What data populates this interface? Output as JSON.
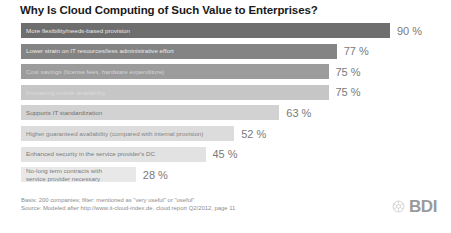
{
  "chart_data": {
    "type": "bar",
    "orientation": "horizontal",
    "title": "Why Is Cloud Computing of Such Value to Enterprises?",
    "xlabel": "",
    "ylabel": "",
    "xlim": [
      0,
      100
    ],
    "grid": false,
    "legend": null,
    "value_suffix": "%",
    "categories": [
      "More flexibility/needs-based provision",
      "Lower strain on IT resources/less administrative effort",
      "Cost savings (license fees, hardware expenditure)",
      "Increasing mobile availability",
      "Supports IT standardization",
      "Higher guaranteed availability (compared with internal provision)",
      "Enhanced security in the service provider's DC",
      "No-long term contracts with service provider necessary"
    ],
    "values": [
      90,
      77,
      75,
      75,
      63,
      52,
      45,
      28
    ],
    "value_labels": [
      "90 %",
      "77 %",
      "75 %",
      "75 %",
      "63 %",
      "52 %",
      "45 %",
      "28 %"
    ],
    "bar_colors": [
      "#6e6e6e",
      "#848484",
      "#9c9c9c",
      "#c6c6c6",
      "#d2d2d2",
      "#dcdcdc",
      "#e2e2e2",
      "#e8e8e8"
    ],
    "label_colors": [
      "#e8e8e8",
      "#eaeaea",
      "#d4d4d4",
      "#dedede",
      "#6f6f6f",
      "#858585",
      "#7a7a7a",
      "#7a7a7a"
    ]
  },
  "bars": [
    {
      "label": "More flexibility/needs-based provision",
      "value": 90,
      "value_label": "90 %",
      "bar_color": "#6e6e6e",
      "label_color": "#e8e8e8",
      "two_line": false
    },
    {
      "label": "Lower strain on IT resources/less administrative effort",
      "value": 77,
      "value_label": "77 %",
      "bar_color": "#848484",
      "label_color": "#eaeaea",
      "two_line": false
    },
    {
      "label": "Cost savings (license fees, hardware expenditure)",
      "value": 75,
      "value_label": "75 %",
      "bar_color": "#9c9c9c",
      "label_color": "#d4d4d4",
      "two_line": false
    },
    {
      "label": "Increasing mobile availability",
      "value": 75,
      "value_label": "75 %",
      "bar_color": "#c6c6c6",
      "label_color": "#dcdcdc",
      "two_line": false
    },
    {
      "label": "Supports IT standardization",
      "value": 63,
      "value_label": "63 %",
      "bar_color": "#d2d2d2",
      "label_color": "#6f6f6f",
      "two_line": false
    },
    {
      "label": "Higher guaranteed availability (compared with internal provision)",
      "value": 52,
      "value_label": "52 %",
      "bar_color": "#dcdcdc",
      "label_color": "#858585",
      "two_line": false
    },
    {
      "label": "Enhanced security in the service provider's DC",
      "value": 45,
      "value_label": "45 %",
      "bar_color": "#e2e2e2",
      "label_color": "#7a7a7a",
      "two_line": false
    },
    {
      "label": "No-long term contracts with service provider necessary",
      "value": 28,
      "value_label": "28 %",
      "bar_color": "#e8e8e8",
      "label_color": "#7a7a7a",
      "two_line": true
    }
  ],
  "footnotes": {
    "basis": "Basis: 200 companies; filter: mentioned as \"very useful\" or \"useful\"",
    "source": "Source: Modeled after http://www.it-cloud-index.de, cloud report Q2/2012, page 11"
  },
  "logo": {
    "text": "BDI",
    "color": "#9a9a9a"
  }
}
